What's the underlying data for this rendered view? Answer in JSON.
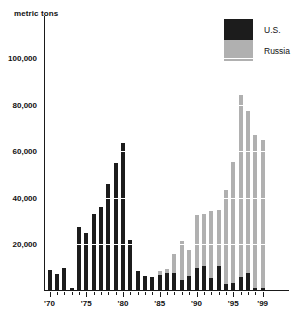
{
  "chart_data": {
    "type": "bar",
    "stacked": true,
    "title": "",
    "subtitle": "",
    "xlabel": "",
    "ylabel": "metric tons",
    "unit_caption": "metric tons",
    "ylim": [
      0,
      118000
    ],
    "ytick_values": [
      20000,
      40000,
      60000,
      80000,
      100000
    ],
    "ytick_labels": [
      "20,000",
      "40,000",
      "60,000",
      "80,000",
      "100,000"
    ],
    "grid": "horizontal-white-over-bars",
    "legend_position": "top-right",
    "categories": [
      "1970",
      "1971",
      "1972",
      "1973",
      "1974",
      "1975",
      "1976",
      "1977",
      "1978",
      "1979",
      "1980",
      "1981",
      "1982",
      "1983",
      "1984",
      "1985",
      "1986",
      "1987",
      "1988",
      "1989",
      "1990",
      "1991",
      "1992",
      "1993",
      "1994",
      "1995",
      "1996",
      "1997",
      "1998",
      "1999"
    ],
    "xtick_labels": [
      "'70",
      "'75",
      "'80",
      "'85",
      "'90",
      "'95",
      "'99"
    ],
    "xtick_categories": [
      "1970",
      "1975",
      "1980",
      "1985",
      "1990",
      "1995",
      "1999"
    ],
    "series": [
      {
        "name": "U.S.",
        "color": "#1c1c1c",
        "values": [
          8500,
          7000,
          9500,
          700,
          27000,
          24500,
          32500,
          35500,
          45500,
          54500,
          63000,
          21500,
          8000,
          6000,
          5500,
          6500,
          7500,
          7500,
          4500,
          6000,
          9500,
          10500,
          5000,
          10500,
          2500,
          3000,
          5500,
          7500,
          1000,
          1000
        ]
      },
      {
        "name": "Russia",
        "color": "#b0b0b0",
        "values": [
          0,
          0,
          0,
          0,
          0,
          0,
          0,
          0,
          0,
          0,
          0,
          0,
          0,
          0,
          0,
          1500,
          1500,
          8000,
          16500,
          11000,
          22500,
          22000,
          29000,
          24000,
          40500,
          52000,
          78000,
          69500,
          65500,
          63500
        ]
      }
    ],
    "totals": [
      8500,
      7000,
      9500,
      700,
      27000,
      24500,
      32500,
      35500,
      45500,
      54500,
      63000,
      21500,
      8000,
      6000,
      5500,
      8000,
      9000,
      15500,
      21000,
      17000,
      32000,
      32500,
      34000,
      34500,
      43000,
      55000,
      83500,
      77000,
      66500,
      64500
    ]
  },
  "legend": {
    "items": [
      {
        "label": "U.S.",
        "color": "#1c1c1c"
      },
      {
        "label": "Russia",
        "color": "#b0b0b0"
      }
    ]
  }
}
